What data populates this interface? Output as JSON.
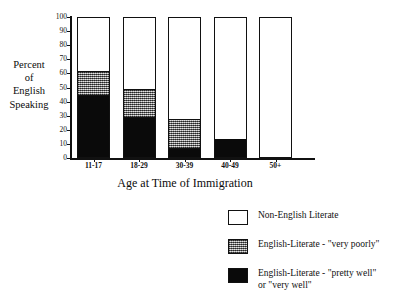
{
  "chart_data": {
    "type": "bar",
    "subtype": "stacked-100-percent",
    "title": "",
    "clipped_title_fragment": "",
    "xlabel": "Age at Time of Immigration",
    "ylabel": "Percent of English Speaking",
    "ylabel_lines": [
      "Percent",
      "of",
      "English",
      "Speaking"
    ],
    "categories": [
      "11-17",
      "18-29",
      "30-39",
      "40-49",
      "50+"
    ],
    "ylim": [
      0,
      100
    ],
    "yticks": [
      0,
      10,
      20,
      30,
      40,
      50,
      60,
      70,
      80,
      90,
      100
    ],
    "ytick_labels": [
      "0",
      "10",
      "20",
      "30",
      "40",
      "50",
      "60",
      "70",
      "80",
      "90",
      "100"
    ],
    "grid": false,
    "legend_position": "bottom-right",
    "series": [
      {
        "name": "English-Literate - \"pretty well\" or \"very well\"",
        "fill": "black",
        "color": "#0a0a0a",
        "values": [
          43,
          28,
          6,
          13,
          0
        ]
      },
      {
        "name": "English-Literate - \"very poorly\"",
        "fill": "gray-stipple",
        "color": "#9a9a9a",
        "values": [
          18,
          20,
          21,
          0,
          0
        ]
      },
      {
        "name": "Non-English Literate",
        "fill": "white",
        "color": "#ffffff",
        "values": [
          39,
          52,
          73,
          87,
          100
        ]
      }
    ],
    "cumulative_tops": {
      "black": [
        43,
        28,
        6,
        13,
        0
      ],
      "gray": [
        61,
        48,
        27,
        13,
        0
      ],
      "white": [
        100,
        100,
        100,
        100,
        100
      ]
    }
  },
  "legend": {
    "items": [
      {
        "label": "Non-English Literate",
        "swatch": "white"
      },
      {
        "label": "English-Literate - \"very poorly\"",
        "swatch": "gray"
      },
      {
        "label": "English-Literate - \"pretty well\"\nor \"very well\"",
        "swatch": "black"
      }
    ]
  }
}
